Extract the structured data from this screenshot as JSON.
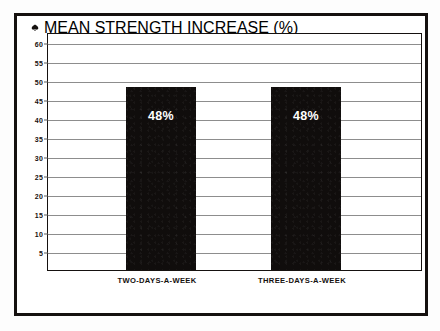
{
  "figure": {
    "title": "MEAN STRENGTH INCREASE (%)",
    "title_marker_icon": "filled-diamond-marker-icon",
    "border_color": "#15110f",
    "background_color": "#ffffff"
  },
  "chart_data": {
    "type": "bar",
    "title": "MEAN STRENGTH INCREASE (%)",
    "xlabel": "",
    "ylabel": "MEAN STRENGTH INCREASE (%)",
    "categories": [
      "TWO-DAYS-A-WEEK",
      "THREE-DAYS-A-WEEK"
    ],
    "values": [
      48,
      48
    ],
    "value_labels": [
      "48%",
      "48%"
    ],
    "ylim": [
      0,
      62.5
    ],
    "yticks": [
      60,
      55,
      50,
      45,
      40,
      35,
      30,
      25,
      20,
      15,
      10,
      5
    ],
    "ytick_labels": [
      "60",
      "55",
      "50",
      "45",
      "40",
      "35",
      "30",
      "25",
      "20",
      "15",
      "10",
      "5"
    ],
    "grid": true,
    "grid_color": "#8d8d8d",
    "legend": false,
    "legend_position": "none",
    "bar_color": "#100d0c",
    "bar_label_color": "#ffffff",
    "series": [
      {
        "name": "Mean strength increase",
        "values": [
          48,
          48
        ]
      }
    ]
  }
}
